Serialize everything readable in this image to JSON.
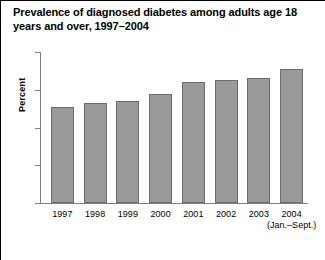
{
  "figure": {
    "title": "Prevalence of diagnosed diabetes among adults age 18 years and over, 1997–2004"
  },
  "chart_data": {
    "type": "bar",
    "title": "Prevalence of diagnosed diabetes among adults age 18 years and over, 1997–2004",
    "categories": [
      "1997",
      "1998",
      "1999",
      "2000",
      "2001",
      "2002",
      "2003",
      "2004"
    ],
    "category_sublabels": [
      "",
      "",
      "",
      "",
      "",
      "",
      "",
      "(Jan.–Sept.)"
    ],
    "values": [
      5.1,
      5.3,
      5.4,
      5.8,
      6.4,
      6.5,
      6.6,
      7.1
    ],
    "xlabel": "",
    "ylabel": "Percent",
    "ylim": [
      0,
      8
    ],
    "yticks": [
      "0",
      "2",
      "4",
      "6",
      "8"
    ],
    "ytick_values": [
      0,
      2,
      4,
      6,
      8
    ],
    "grid": false,
    "legend": false,
    "bar_color": "#9a9a9a",
    "bar_edge_color": "#6b6b6b",
    "axis_color": "#808080",
    "text_color": "#000000",
    "background_color": "#ffffff"
  }
}
